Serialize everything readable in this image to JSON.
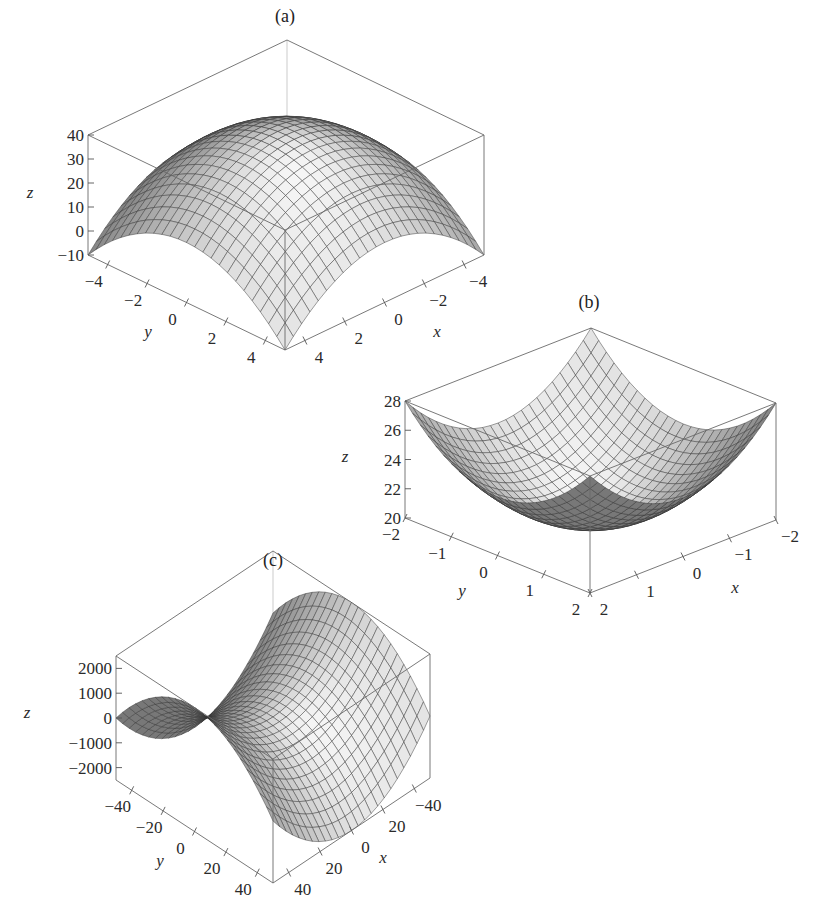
{
  "chart_data": [
    {
      "type": "surface",
      "title": "(a)",
      "function": "z = 40 - x^2 - y^2",
      "xlabel": "x",
      "ylabel": "y",
      "zlabel": "z",
      "xlim": [
        -5,
        5
      ],
      "ylim": [
        -5,
        5
      ],
      "zlim": [
        -10,
        40
      ],
      "x_ticks": [
        -4,
        -2,
        0,
        2,
        4
      ],
      "x_tick_labels": [
        "−4",
        "−2",
        "0",
        "2",
        "4"
      ],
      "y_ticks": [
        -4,
        -2,
        0,
        2,
        4
      ],
      "y_tick_labels": [
        "−4",
        "−2",
        "0",
        "2",
        "4"
      ],
      "z_ticks": [
        -10,
        0,
        10,
        20,
        30,
        40
      ],
      "z_tick_labels": [
        "−10",
        "0",
        "10",
        "20",
        "30",
        "40"
      ],
      "grid_n": 24,
      "shape": "dome (maximum 40 at origin, corners -10)"
    },
    {
      "type": "surface",
      "title": "(b)",
      "function": "z = 20 + x^2 + y^2",
      "xlabel": "x",
      "ylabel": "y",
      "zlabel": "z",
      "xlim": [
        -2,
        2
      ],
      "ylim": [
        -2,
        2
      ],
      "zlim": [
        20,
        28
      ],
      "x_ticks": [
        -2,
        -1,
        0,
        1,
        2
      ],
      "x_tick_labels": [
        "−2",
        "−1",
        "0",
        "1",
        "2"
      ],
      "y_ticks": [
        -2,
        -1,
        0,
        1,
        2
      ],
      "y_tick_labels": [
        "−2",
        "−1",
        "0",
        "1",
        "2"
      ],
      "z_ticks": [
        20,
        22,
        24,
        26,
        28
      ],
      "z_tick_labels": [
        "20",
        "22",
        "24",
        "26",
        "28"
      ],
      "grid_n": 24,
      "shape": "bowl (minimum 20 at origin, corners 28)"
    },
    {
      "type": "surface",
      "title": "(c)",
      "function": "z = x^2 - y^2",
      "xlabel": "x",
      "ylabel": "y",
      "zlabel": "z",
      "xlim": [
        -50,
        50
      ],
      "ylim": [
        -50,
        50
      ],
      "zlim": [
        -2500,
        2500
      ],
      "x_ticks": [
        -40,
        -20,
        0,
        20,
        40
      ],
      "x_tick_labels": [
        "−40",
        "20",
        "0",
        "20",
        "40"
      ],
      "y_ticks": [
        -40,
        -20,
        0,
        20,
        40
      ],
      "y_tick_labels": [
        "−40",
        "−20",
        "0",
        "20",
        "40"
      ],
      "z_ticks": [
        -2000,
        -1000,
        0,
        1000,
        2000
      ],
      "z_tick_labels": [
        "−2000",
        "−1000",
        "0",
        "1000",
        "2000"
      ],
      "grid_n": 24,
      "shape": "saddle"
    }
  ],
  "layout": {
    "panels": [
      {
        "id": "a",
        "title_pos": [
          285,
          22
        ],
        "origin_front_bottom": [
          285,
          350
        ],
        "corner_left_bottom": [
          88,
          255
        ],
        "corner_right_bottom": [
          484,
          255
        ],
        "z_height_px": 120,
        "z_label_pos": [
          30,
          198
        ],
        "y_label_pos": [
          148,
          337
        ],
        "x_label_pos": [
          437,
          337
        ]
      },
      {
        "id": "b",
        "title_pos": [
          589,
          308
        ],
        "origin_front_bottom": [
          590,
          593
        ],
        "corner_left_bottom": [
          405,
          518
        ],
        "corner_right_bottom": [
          776,
          520
        ],
        "z_height_px": 117,
        "z_label_pos": [
          345,
          462
        ],
        "y_label_pos": [
          462,
          596
        ],
        "x_label_pos": [
          735,
          593
        ]
      },
      {
        "id": "c",
        "title_pos": [
          273,
          566
        ],
        "origin_front_bottom": [
          273,
          883
        ],
        "corner_left_bottom": [
          116,
          780
        ],
        "corner_right_bottom": [
          430,
          778
        ],
        "z_height_px": 124,
        "z_label_pos": [
          27,
          718
        ],
        "y_label_pos": [
          160,
          866
        ],
        "x_label_pos": [
          383,
          863
        ]
      }
    ]
  }
}
